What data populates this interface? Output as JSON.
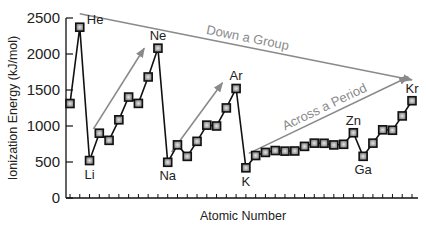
{
  "chart_data": {
    "type": "line",
    "title": "",
    "xlabel": "Atomic Number",
    "ylabel": "Ionization Energy (kJ/mol)",
    "ylim": [
      0,
      2500
    ],
    "yticks": [
      0,
      500,
      1000,
      1500,
      2000,
      2500
    ],
    "grid": false,
    "legend": null,
    "x": [
      1,
      2,
      3,
      4,
      5,
      6,
      7,
      8,
      9,
      10,
      11,
      12,
      13,
      14,
      15,
      16,
      17,
      18,
      19,
      20,
      21,
      22,
      23,
      24,
      25,
      26,
      27,
      28,
      29,
      30,
      31,
      32,
      33,
      34,
      35,
      36
    ],
    "series": [
      {
        "name": "First Ionization Energy",
        "values": [
          1312,
          2372,
          520,
          900,
          801,
          1086,
          1402,
          1314,
          1681,
          2081,
          496,
          738,
          578,
          787,
          1012,
          1000,
          1251,
          1521,
          419,
          590,
          633,
          659,
          651,
          653,
          717,
          762,
          760,
          737,
          746,
          906,
          579,
          762,
          947,
          941,
          1140,
          1351
        ]
      }
    ],
    "point_labels": [
      {
        "index": 1,
        "text": "He",
        "pos": "above-right"
      },
      {
        "index": 2,
        "text": "Li",
        "pos": "below"
      },
      {
        "index": 9,
        "text": "Ne",
        "pos": "above"
      },
      {
        "index": 10,
        "text": "Na",
        "pos": "below"
      },
      {
        "index": 17,
        "text": "Ar",
        "pos": "above"
      },
      {
        "index": 18,
        "text": "K",
        "pos": "below"
      },
      {
        "index": 29,
        "text": "Zn",
        "pos": "above"
      },
      {
        "index": 30,
        "text": "Ga",
        "pos": "below"
      },
      {
        "index": 35,
        "text": "Kr",
        "pos": "above"
      }
    ],
    "annotations": [
      {
        "text": "Down a Group",
        "type": "arrow",
        "from": [
          2,
          2560
        ],
        "to": [
          36,
          1640
        ]
      },
      {
        "text": "Across a Period",
        "type": "arrow",
        "from": [
          19.3,
          620
        ],
        "to": [
          35.6,
          1680
        ]
      },
      {
        "text": "",
        "type": "arrow",
        "from": [
          3.4,
          960
        ],
        "to": [
          8.6,
          2080
        ]
      },
      {
        "text": "",
        "type": "arrow",
        "from": [
          11.4,
          640
        ],
        "to": [
          16.6,
          1600
        ]
      }
    ],
    "colors": {
      "line": "#111111",
      "marker_fill": "#9a9a9a",
      "marker_edge": "#111111",
      "annotation": "#8a8a8a"
    }
  }
}
